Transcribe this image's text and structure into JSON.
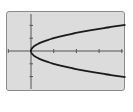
{
  "chart_data": {
    "type": "line",
    "title": "",
    "xlabel": "",
    "ylabel": "",
    "equation": "y^2 = x",
    "xlim": [
      -1,
      4
    ],
    "ylim": [
      -3,
      3
    ],
    "x_ticks": [
      -1,
      1,
      2,
      3,
      4
    ],
    "y_ticks": [
      -2,
      -1,
      1,
      2
    ],
    "grid": false,
    "legend": null,
    "series": [
      {
        "name": "upper branch",
        "x": [
          0,
          0.25,
          1,
          2,
          3,
          4
        ],
        "y": [
          0,
          0.5,
          1,
          1.414,
          1.732,
          2
        ]
      },
      {
        "name": "lower branch",
        "x": [
          0,
          0.25,
          1,
          2,
          3,
          4
        ],
        "y": [
          0,
          -0.5,
          -1,
          -1.414,
          -1.732,
          -2
        ]
      }
    ]
  },
  "colors": {
    "screen_background": "#dcdcdc",
    "screen_border": "#8a8a8a",
    "axis": "#555555",
    "curve": "#1a1a1a"
  }
}
